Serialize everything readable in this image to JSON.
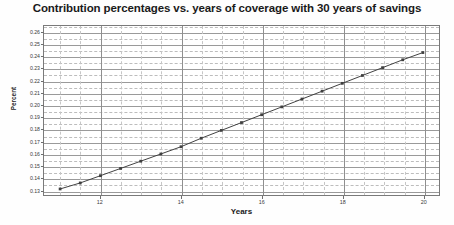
{
  "chart_data": {
    "type": "line",
    "title": "Contribution percentages vs. years of coverage with 30 years of savings",
    "xlabel": "Years",
    "ylabel": "Percent",
    "xlim": [
      10.6,
      20.4
    ],
    "ylim": [
      0.1255,
      0.2655
    ],
    "grid": true,
    "legend": "none",
    "xticks": [
      12,
      14,
      16,
      18,
      20
    ],
    "yticks": [
      0.13,
      0.14,
      0.15,
      0.16,
      0.17,
      0.18,
      0.19,
      0.2,
      0.21,
      0.22,
      0.23,
      0.24,
      0.25,
      0.26
    ],
    "ytick_labels": [
      "0.13",
      "0.14",
      "0.15",
      "0.16",
      "0.17",
      "0.18",
      "0.19",
      "0.20",
      "0.21",
      "0.22",
      "0.23",
      "0.24",
      "0.25",
      "0.26"
    ],
    "xtick_labels": [
      "12",
      "14",
      "16",
      "18",
      "20"
    ],
    "series": [
      {
        "name": "Contribution percentage",
        "color": "#404040",
        "marker": "square",
        "x": [
          11,
          11.5,
          12,
          12.5,
          13,
          13.5,
          14,
          14.5,
          15,
          15.5,
          16,
          16.5,
          17,
          17.5,
          18,
          18.5,
          19,
          19.5,
          20
        ],
        "values": [
          0.1305,
          0.1355,
          0.1415,
          0.1475,
          0.1535,
          0.1595,
          0.1655,
          0.1725,
          0.179,
          0.1855,
          0.192,
          0.1985,
          0.205,
          0.2115,
          0.218,
          0.2245,
          0.231,
          0.2375,
          0.2435
        ]
      }
    ]
  }
}
